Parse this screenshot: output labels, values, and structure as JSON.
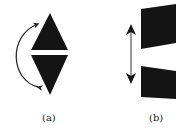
{
  "figure": {
    "panels": [
      {
        "id": "a",
        "label": "(a)",
        "description": "Two black triangles (up and down) stacked with a thin gap, curved double-headed arrow on the left indicating rotation/flip"
      },
      {
        "id": "b",
        "label": "(b)",
        "description": "Two black slanted quadrilateral plates separated by a gap, vertical double-headed arrow on the left indicating translation"
      }
    ],
    "colors": {
      "shape_fill": "#141414",
      "arrow": "#2a2a2a",
      "background": "#ffffff"
    }
  }
}
